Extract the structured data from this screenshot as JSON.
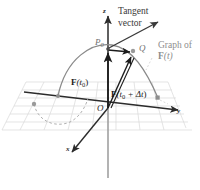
{
  "figure": {
    "kind": "3d-vector-calculus-diagram",
    "background_color": "#ffffff",
    "annotations": {
      "tangent_line1": "Tangent",
      "tangent_line2": "vector",
      "graph_line1": "Graph of",
      "graph_line2_prefix": "F",
      "graph_line2_arg": "(t)"
    },
    "points": {
      "p0_letter": "P",
      "p0_sub": "0",
      "q_letter": "Q",
      "origin": "O"
    },
    "vectors": {
      "f_t0_bold": "F",
      "f_t0_arg_open": "(t",
      "f_t0_arg_sub": "0",
      "f_t0_arg_close": ")",
      "f_tdt_bold": "F",
      "f_tdt_arg_open": "(t",
      "f_tdt_arg_sub": "0",
      "f_tdt_arg_mid": " + Δt",
      "f_tdt_arg_close": ")"
    },
    "axes": {
      "x_label": "x",
      "y_label": "y",
      "z_label": "z"
    },
    "colors": {
      "grid": "#d9d9d9",
      "axis": "#2b2b2b",
      "z_axis_lower": "#9a9a9a",
      "curve": "#8a8a8a",
      "curve_dashed": "#b0b0b0",
      "vector_dark": "#1c1c1c",
      "tangent": "#3a3a3a",
      "point_marker": "#8e8e8e",
      "label_faint": "#8e8e8e",
      "label_dark": "#262626"
    }
  }
}
